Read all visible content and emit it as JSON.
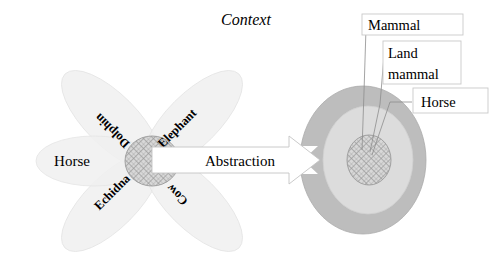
{
  "figure": {
    "title": "Context",
    "arrow_label": "Abstraction"
  },
  "context_diagram": {
    "name": "context-flower",
    "center_label": "",
    "petals": [
      {
        "id": "horse",
        "label": "Horse",
        "rotation": 0,
        "orientation": "horizontal"
      },
      {
        "id": "dolphin",
        "label": "Dolphin",
        "rotation": 225,
        "orientation": "diagonal-upside-down"
      },
      {
        "id": "elephant",
        "label": "Elephant",
        "rotation": -45,
        "orientation": "diagonal-up"
      },
      {
        "id": "echidna",
        "label": "Echidna",
        "rotation": -45,
        "orientation": "diagonal-up"
      },
      {
        "id": "cow",
        "label": "Cow",
        "rotation": 225,
        "orientation": "diagonal-upside-down"
      }
    ]
  },
  "abstraction_diagram": {
    "name": "abstraction-target",
    "rings": [
      {
        "id": "outer",
        "label": "Mammal",
        "fill": "#b9b9b9"
      },
      {
        "id": "middle",
        "label": "Land mammal",
        "fill": "#d9d9d9"
      },
      {
        "id": "core",
        "label": "Horse",
        "fill": "#d2d2d2"
      }
    ],
    "callouts": [
      {
        "id": "mammal",
        "lines": [
          "Mammal"
        ]
      },
      {
        "id": "land-mammal",
        "lines": [
          "Land",
          "mammal"
        ]
      },
      {
        "id": "horse",
        "lines": [
          "Horse"
        ]
      }
    ]
  },
  "colors": {
    "petal_fill": "#f2f2f2",
    "petal_stroke": "#e2e2e2",
    "ring_outer": "#b9b9b9",
    "ring_middle": "#d9d9d9",
    "core_fill": "#d2d2d2",
    "hatch_stroke": "#9a9a9a",
    "arrow_fill": "#ffffff",
    "arrow_stroke": "#bdbdbd",
    "text": "#000000"
  }
}
